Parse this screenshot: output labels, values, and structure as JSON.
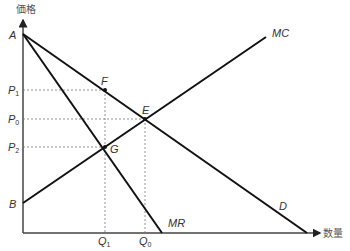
{
  "diagram": {
    "type": "monopoly-price-diagram",
    "axes": {
      "y_label": "価格",
      "x_label": "数量"
    },
    "curves": {
      "mc": "MC",
      "mr": "MR",
      "d": "D"
    },
    "points": {
      "a": "A",
      "b": "B",
      "e": "E",
      "f": "F",
      "g": "G"
    },
    "price_labels": {
      "p1": "P",
      "p1_sub": "1",
      "p0": "P",
      "p0_sub": "0",
      "p2": "P",
      "p2_sub": "2"
    },
    "quantity_labels": {
      "q1": "Q",
      "q1_sub": "1",
      "q0": "Q",
      "q0_sub": "0"
    },
    "colors": {
      "line": "#111111",
      "dashed": "#666666",
      "text": "#333333"
    }
  }
}
